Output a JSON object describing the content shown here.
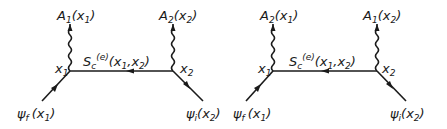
{
  "diagrams": [
    {
      "id": "left",
      "top_left_label": {
        "base": "A",
        "sub": "1",
        "arg": "(x",
        "argsub": "1",
        "close": ")"
      },
      "top_right_label": {
        "base": "A",
        "sub": "2",
        "arg": "(x",
        "argsub": "2",
        "close": ")"
      },
      "vertex_left": {
        "base": "x",
        "sub": "1"
      },
      "vertex_right": {
        "base": "x",
        "sub": "2"
      },
      "propagator": {
        "base": "S",
        "sub": "c",
        "sup": "(e)",
        "arg": "(x",
        "a1": "1",
        "mid": ",x",
        "a2": "2",
        "close": ")"
      },
      "bottom_left_label": {
        "base": "ψ",
        "sub": "f",
        "arg": "(x",
        "argsub": "1",
        "close": ")"
      },
      "bottom_right_label": {
        "base": "ψ",
        "sub": "i",
        "arg": "(x",
        "argsub": "2",
        "close": ")"
      },
      "propagator_arrow": "left"
    },
    {
      "id": "right",
      "top_left_label": {
        "base": "A",
        "sub": "2",
        "arg": "(x",
        "argsub": "1",
        "close": ")"
      },
      "top_right_label": {
        "base": "A",
        "sub": "1",
        "arg": "(x",
        "argsub": "2",
        "close": ")"
      },
      "vertex_left": {
        "base": "x",
        "sub": "1"
      },
      "vertex_right": {
        "base": "x",
        "sub": "2"
      },
      "propagator": {
        "base": "S",
        "sub": "c",
        "sup": "(e)",
        "arg": "(x",
        "a1": "1",
        "mid": ",x",
        "a2": "2",
        "close": ")"
      },
      "bottom_left_label": {
        "base": "ψ",
        "sub": "f",
        "arg": "(x",
        "argsub": "1",
        "close": ")"
      },
      "bottom_right_label": {
        "base": "ψ",
        "sub": "i",
        "arg": "(x",
        "argsub": "2",
        "close": ")"
      },
      "propagator_arrow": "left"
    }
  ],
  "colors": {
    "ink": "#1a1a1a",
    "background": "#ffffff"
  }
}
